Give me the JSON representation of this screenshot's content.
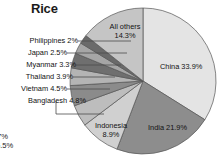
{
  "chart_data": {
    "type": "pie",
    "title": "Rice",
    "xlabel": "",
    "ylabel": "",
    "unit": "percent",
    "start_angle_deg": 0,
    "direction": "clockwise",
    "categories": [
      "China",
      "India",
      "Indonesia",
      "Bangladesh",
      "Vietnam",
      "Thailand",
      "Myanmar",
      "Japan",
      "Philippines",
      "All others"
    ],
    "values": [
      33.9,
      21.9,
      8.9,
      4.8,
      4.5,
      3.9,
      3.3,
      2.5,
      2.0,
      14.3
    ],
    "slices": [
      {
        "name": "China",
        "value": 33.9,
        "label": "China 33.9%",
        "display": "inside",
        "color": "#e4e4e4"
      },
      {
        "name": "India",
        "value": 21.9,
        "label": "India 21.9%",
        "display": "inside",
        "color": "#8d8d8d"
      },
      {
        "name": "Indonesia",
        "value": 8.9,
        "label": "Indonesia",
        "label2": "8.9%",
        "display": "inside",
        "color": "#d0d0d0"
      },
      {
        "name": "Bangladesh",
        "value": 4.8,
        "label": "Bangladesh 4.8%",
        "display": "outside",
        "color": "#bdbdbd"
      },
      {
        "name": "Vietnam",
        "value": 4.5,
        "label": "Vietnam 4.5%",
        "display": "outside",
        "color": "#8b8b8b"
      },
      {
        "name": "Thailand",
        "value": 3.9,
        "label": "Thailand 3.9%",
        "display": "outside",
        "color": "#b4b4b4"
      },
      {
        "name": "Myanmar",
        "value": 3.3,
        "label": "Myanmar 3.3%",
        "display": "outside",
        "color": "#6f6f6f"
      },
      {
        "name": "Japan",
        "value": 2.5,
        "label": "Japan 2.5%",
        "display": "outside",
        "color": "#a6a6a6"
      },
      {
        "name": "Philippines",
        "value": 2.0,
        "label": "Philippines 2%",
        "display": "outside",
        "color": "#6a6a6a"
      },
      {
        "name": "All others",
        "value": 14.3,
        "label": "All others",
        "label2": "14.3%",
        "display": "inside",
        "color": "#c5c5c5"
      }
    ],
    "legend": "none",
    "grid": false
  },
  "title": "Rice",
  "labels": {
    "all_others_line1": "All others",
    "all_others_line2": "14.3%",
    "china": "China 33.9%",
    "india": "India 21.9%",
    "indonesia_line1": "Indonesia",
    "indonesia_line2": "8.9%",
    "philippines": "Philippines 2%",
    "japan": "Japan 2.5%",
    "myanmar": "Myanmar 3.3%",
    "thailand": "Thailand 3.9%",
    "vietnam": "Vietnam 4.5%",
    "bangladesh": "Bangladesh 4.8%"
  },
  "clipped_fragments": {
    "fragment_top": "7%",
    "fragment_bottom": "5.5%"
  },
  "colors": {
    "background": "#ffffff",
    "text": "#111111",
    "outline": "#555555"
  }
}
